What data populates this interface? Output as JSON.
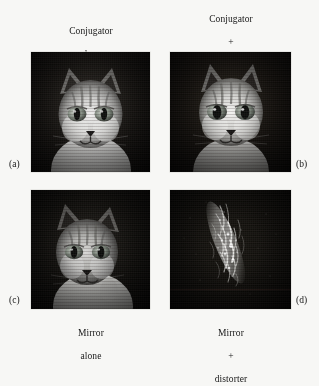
{
  "figure": {
    "background_color": "#f7f7f5",
    "panel_background_color": "#0a0a08",
    "layout": "2x2 grid of grayscale photographic panels with serif captions",
    "captions": {
      "top_left": {
        "line1": "Conjugator",
        "line2": "alone"
      },
      "top_right": {
        "line1": "Conjugator",
        "line2": "+",
        "line3": "distorter"
      },
      "bottom_left": {
        "line1": "Mirror",
        "line2": "alone"
      },
      "bottom_right": {
        "line1": "Mirror",
        "line2": "+",
        "line3": "distorter"
      }
    },
    "panel_letters": {
      "a": "(a)",
      "b": "(b)",
      "c": "(c)",
      "d": "(d)"
    },
    "panels": [
      {
        "letter": "(a)",
        "caption": "Conjugator alone",
        "subject": "cat-face-photograph",
        "description": "sharp grayscale cat face, bright fur, dark background"
      },
      {
        "letter": "(b)",
        "caption": "Conjugator + distorter",
        "subject": "cat-face-photograph",
        "description": "sharp grayscale cat face restored through distorter"
      },
      {
        "letter": "(c)",
        "caption": "Mirror alone",
        "subject": "cat-face-photograph",
        "description": "slightly softer darker grayscale cat face"
      },
      {
        "letter": "(d)",
        "caption": "Mirror + distorter",
        "subject": "speckle-pattern",
        "description": "scrambled diagonal bright speckle streak, image destroyed"
      }
    ]
  }
}
